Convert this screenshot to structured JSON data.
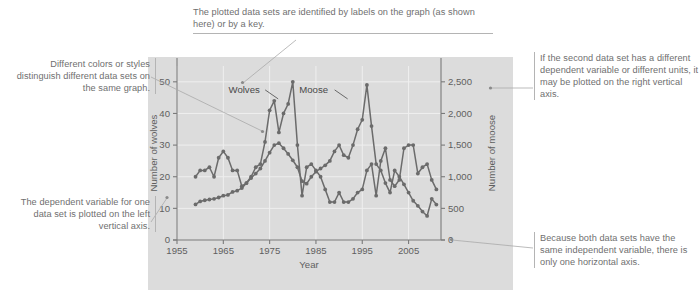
{
  "figure": {
    "panel_color": "#dcdcdc",
    "series_color": "#6b6b6b",
    "grid_color": "#efefef",
    "axis_color": "#7a7a7a",
    "leader_color": "#a9a9a9"
  },
  "callouts": {
    "top": "The plotted data sets are identified by labels on the graph (as shown here) or by a key.",
    "left_top": "Different colors or styles distinguish different data sets on the same graph.",
    "left_bottom": "The dependent variable for one data set is plotted on the left vertical axis.",
    "right_top": "If the second data set has a different dependent variable or different units, it may be plotted on the right vertical axis.",
    "right_bottom": "Because both data sets have the same independent variable, there is only one horizontal axis."
  },
  "chart_data": {
    "type": "line",
    "title": "",
    "xlabel": "Year",
    "ylabel": "Number of wolves",
    "y2label": "Number of moose",
    "xlim": [
      1955,
      2012
    ],
    "ylim": [
      0,
      55
    ],
    "y2lim": [
      0,
      2750
    ],
    "xticks": [
      1955,
      1965,
      1975,
      1985,
      1995,
      2005
    ],
    "xtick_labels": [
      "1955",
      "1965",
      "1975",
      "1985",
      "1995",
      "2005"
    ],
    "yticks": [
      0,
      10,
      20,
      30,
      40,
      50
    ],
    "ytick_labels": [
      "0",
      "10",
      "20",
      "30",
      "40",
      "50"
    ],
    "y2ticks": [
      0,
      500,
      1000,
      1500,
      2000,
      2500
    ],
    "y2tick_labels": [
      "0",
      "500",
      "1,000",
      "1,500",
      "2,000",
      "2,500"
    ],
    "grid": true,
    "legend_position": "inline-labels",
    "annotations": [
      {
        "text": "Wolves",
        "x": 1969.5,
        "y": 46.5
      },
      {
        "text": "Moose",
        "x": 1984.5,
        "y": 46.5
      }
    ],
    "series": [
      {
        "name": "Wolves",
        "axis": "left",
        "x": [
          1959,
          1960,
          1961,
          1962,
          1963,
          1964,
          1965,
          1966,
          1967,
          1968,
          1969,
          1970,
          1971,
          1972,
          1973,
          1974,
          1975,
          1976,
          1977,
          1978,
          1979,
          1980,
          1981,
          1982,
          1983,
          1984,
          1985,
          1986,
          1987,
          1988,
          1989,
          1990,
          1991,
          1992,
          1993,
          1994,
          1995,
          1996,
          1997,
          1998,
          1999,
          2000,
          2001,
          2002,
          2003,
          2004,
          2005,
          2006,
          2007,
          2008,
          2009,
          2010,
          2011
        ],
        "values": [
          20,
          22,
          22,
          23,
          20,
          26,
          28,
          26,
          22,
          22,
          17,
          18,
          20,
          23,
          24,
          31,
          41,
          44,
          34,
          40,
          43,
          50,
          30,
          14,
          23,
          24,
          22,
          20,
          16,
          12,
          12,
          15,
          12,
          12,
          13,
          15,
          16,
          22,
          24,
          14,
          25,
          29,
          19,
          17,
          19,
          29,
          30,
          30,
          21,
          23,
          24,
          19,
          16
        ]
      },
      {
        "name": "Moose",
        "axis": "right",
        "x": [
          1959,
          1960,
          1961,
          1962,
          1963,
          1964,
          1965,
          1966,
          1967,
          1968,
          1969,
          1970,
          1971,
          1972,
          1973,
          1974,
          1975,
          1976,
          1977,
          1978,
          1979,
          1980,
          1981,
          1982,
          1983,
          1984,
          1985,
          1986,
          1987,
          1988,
          1989,
          1990,
          1991,
          1992,
          1993,
          1994,
          1995,
          1996,
          1997,
          1998,
          1999,
          2000,
          2001,
          2002,
          2003,
          2004,
          2005,
          2006,
          2007,
          2008,
          2009,
          2010,
          2011
        ],
        "values": [
          563,
          610,
          628,
          640,
          650,
          672,
          700,
          713,
          760,
          780,
          820,
          900,
          980,
          1050,
          1130,
          1250,
          1380,
          1500,
          1530,
          1450,
          1360,
          1260,
          1150,
          930,
          890,
          1000,
          1080,
          1130,
          1180,
          1250,
          1400,
          1500,
          1340,
          1300,
          1500,
          1750,
          1900,
          2450,
          1800,
          1200,
          1100,
          900,
          750,
          1100,
          1000,
          880,
          750,
          620,
          540,
          450,
          380,
          650,
          560
        ]
      }
    ]
  }
}
